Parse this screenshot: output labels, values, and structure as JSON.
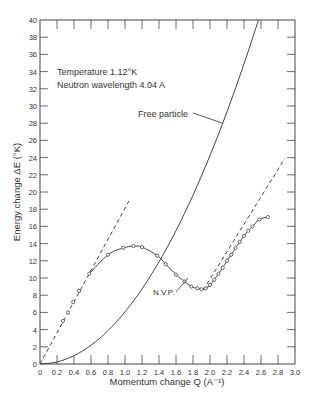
{
  "chart_data": {
    "type": "line",
    "title": "",
    "xlabel": "Momentum change Q (A⁻¹)",
    "ylabel": "Energy change ΔE (°K)",
    "xlim": [
      0,
      3.0
    ],
    "ylim": [
      0,
      40
    ],
    "x_ticks": [
      "0",
      "0.2",
      "0.4",
      "0.6",
      "0.8",
      "1.0",
      "1.2",
      "1.4",
      "1.6",
      "1.8",
      "2.0",
      "2.2",
      "2.4",
      "2.6",
      "2.8",
      "3.0"
    ],
    "y_ticks": [
      "0",
      "2",
      "4",
      "6",
      "8",
      "10",
      "12",
      "14",
      "16",
      "18",
      "20",
      "22",
      "24",
      "26",
      "28",
      "30",
      "32",
      "34",
      "36",
      "38",
      "40"
    ],
    "grid": false,
    "annotations": [
      {
        "text": "Temperature 1.12°K",
        "x": 0.18,
        "y": 33.8
      },
      {
        "text": "Neutron wavelength 4.04 A",
        "x": 0.18,
        "y": 32.4
      },
      {
        "text": "Free particle",
        "x": 1.3,
        "y": 29.3
      },
      {
        "text": "N.V.P.",
        "x": 1.38,
        "y": 9.6
      }
    ],
    "series": [
      {
        "name": "Measured dispersion (N.V.P.)",
        "style": "solid-with-markers",
        "x": [
          0.27,
          0.33,
          0.39,
          0.46,
          0.58,
          0.8,
          0.98,
          1.1,
          1.2,
          1.38,
          1.48,
          1.6,
          1.7,
          1.78,
          1.85,
          1.9,
          1.95,
          2.0,
          2.05,
          2.1,
          2.15,
          2.2,
          2.25,
          2.3,
          2.35,
          2.4,
          2.45,
          2.5,
          2.58,
          2.68
        ],
        "y": [
          5.0,
          6.0,
          7.2,
          8.5,
          10.5,
          12.7,
          13.5,
          13.7,
          13.6,
          12.6,
          11.6,
          10.4,
          9.6,
          9.0,
          8.8,
          8.7,
          8.8,
          9.2,
          9.8,
          10.5,
          11.2,
          12.0,
          12.7,
          13.5,
          14.2,
          14.9,
          15.5,
          16.0,
          16.8,
          17.1
        ]
      },
      {
        "name": "Free particle",
        "style": "solid",
        "x": [
          0,
          0.2,
          0.4,
          0.6,
          0.8,
          1.0,
          1.2,
          1.4,
          1.6,
          1.8,
          2.0,
          2.2,
          2.4,
          2.57
        ],
        "y": [
          0,
          0.24,
          0.97,
          2.18,
          3.88,
          6.06,
          8.73,
          11.88,
          15.51,
          19.63,
          24.24,
          29.33,
          34.9,
          40.0
        ]
      },
      {
        "name": "Phonon slope",
        "style": "dashed",
        "x": [
          0,
          1.06
        ],
        "y": [
          0,
          19.2
        ]
      },
      {
        "name": "Roton slope",
        "style": "dashed",
        "x": [
          1.92,
          2.88
        ],
        "y": [
          8.6,
          23.9
        ]
      }
    ]
  },
  "labels": {
    "temperature": "Temperature 1.12°K",
    "wavelength": "Neutron wavelength 4.04 A",
    "free_particle": "Free particle",
    "nvp": "N.V.P.",
    "xlabel": "Momentum change Q (A⁻¹)",
    "ylabel": "Energy change ΔE (°K)"
  }
}
